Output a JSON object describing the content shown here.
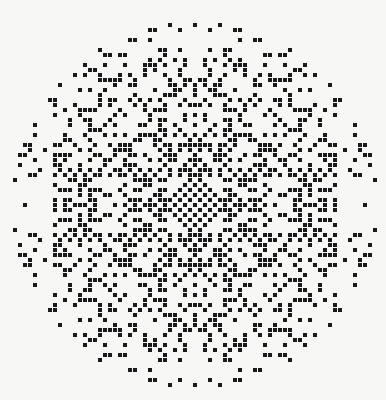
{
  "image": {
    "title": "Dot matrix mandala",
    "kind": "generated-dot-pattern",
    "width": 386,
    "height": 400,
    "background_color": "#f7f7f5",
    "dot_color": "#1a1a1a",
    "description": "Circular field of small black squares on an off-white ground, arranged on a regular grid with four-fold mirror symmetry; dense near the centre and sparser toward the rim."
  },
  "pattern": {
    "grid_pitch_px": 5,
    "dot_size_px": 4,
    "center_x_px": 195,
    "center_y_px": 205,
    "clip_radius_px": 183,
    "symmetry": "4-fold mirror (horizontal and vertical axes)",
    "rule_name": "gcd-modular-resonance",
    "rule_modulus": 7,
    "rule_threshold": 2,
    "density_falloff": "linear-with-radius",
    "motifs": [
      "central dense plus/cross",
      "open diamond rings in the mid-band",
      "small four-dot plus clusters",
      "scattered single dots near the rim"
    ]
  },
  "chart_data": {
    "type": "scatter",
    "xlabel": "",
    "ylabel": "",
    "xlim": [
      0,
      386
    ],
    "ylim": [
      0,
      400
    ],
    "grid": false,
    "legend": "none",
    "marker": "square",
    "marker_size_px": 4,
    "marker_color": "#1a1a1a",
    "approx_point_count": 1150
  }
}
